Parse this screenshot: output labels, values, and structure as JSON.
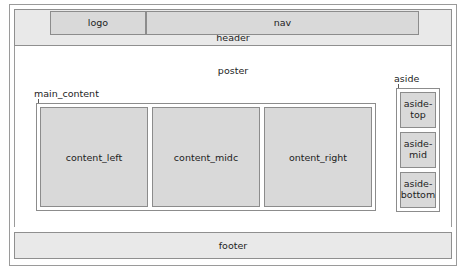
{
  "diagram": {
    "type": "html-page-layout-wireframe",
    "outer_frame_label": "",
    "header": {
      "label": "header",
      "logo_label": "logo",
      "nav_label": "nav"
    },
    "poster": {
      "label": "poster"
    },
    "main_content": {
      "callout_label": "main_content",
      "columns": [
        {
          "label": "content_left"
        },
        {
          "label": "content_midc"
        },
        {
          "label": "ontent_right"
        }
      ]
    },
    "aside": {
      "callout_label": "aside",
      "boxes": [
        {
          "label": "aside-\ntop"
        },
        {
          "label": "aside-\nmid"
        },
        {
          "label": "aside-\nbottom"
        }
      ]
    },
    "footer": {
      "label": "footer"
    },
    "colors": {
      "box_fill": "#d9d9d9",
      "strip_fill": "#e9e9e9",
      "border": "#8c8c8c",
      "outer_border": "#9a9a9a",
      "text": "#1d1d1d",
      "background": "#ffffff"
    }
  }
}
